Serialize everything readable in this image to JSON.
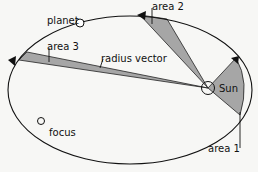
{
  "diagram": {
    "labels": {
      "planet": "planet",
      "area_1": "area 1",
      "area_2": "area 2",
      "area_3": "area 3",
      "radius_vector": "radius vector",
      "sun": "Sun",
      "focus": "focus"
    },
    "colors": {
      "background": "#f7f7f5",
      "orbit": "#111111",
      "shaded_area": "#a6a6a6",
      "text": "#111111"
    }
  }
}
